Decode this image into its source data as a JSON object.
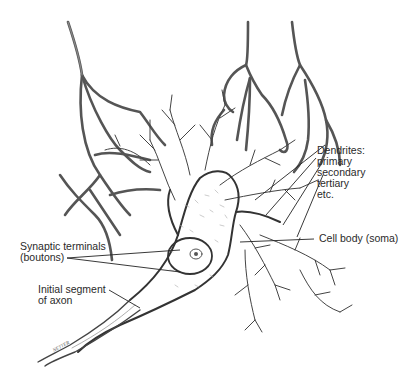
{
  "diagram": {
    "labels": {
      "dendrites": {
        "title": "Dendrites:",
        "items": [
          "primary",
          "secondary",
          "tertiary",
          "etc."
        ]
      },
      "cell_body": "Cell body (soma)",
      "synaptic_terminals": {
        "line1": "Synaptic terminals",
        "line2": "(boutons)"
      },
      "axon_segment": {
        "line1": "Initial segment",
        "line2": "of axon"
      }
    },
    "signature": "NETTER",
    "colors": {
      "ink": "#3a3a3a",
      "fiber_fill": "#9a9a9a",
      "background": "#ffffff"
    }
  }
}
